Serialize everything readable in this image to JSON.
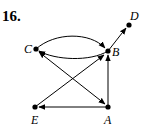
{
  "problem_number": "16.",
  "nodes": [
    {
      "id": "A",
      "label": "A",
      "x": 108,
      "y": 107
    },
    {
      "id": "B",
      "label": "B",
      "x": 108,
      "y": 51
    },
    {
      "id": "C",
      "label": "C",
      "x": 36,
      "y": 49
    },
    {
      "id": "D",
      "label": "D",
      "x": 129,
      "y": 25
    },
    {
      "id": "E",
      "label": "E",
      "x": 35,
      "y": 107
    }
  ],
  "edges": [
    {
      "from": "C",
      "to": "B",
      "shape": "arc-upper"
    },
    {
      "from": "B",
      "to": "C",
      "shape": "arc-lower"
    },
    {
      "from": "B",
      "to": "D",
      "shape": "straight"
    },
    {
      "from": "A",
      "to": "B",
      "shape": "straight"
    },
    {
      "from": "A",
      "to": "E",
      "shape": "straight"
    },
    {
      "from": "E",
      "to": "B",
      "shape": "straight"
    },
    {
      "from": "C",
      "to": "A",
      "shape": "straight"
    },
    {
      "from": "A",
      "to": "C",
      "shape": "straight"
    }
  ]
}
